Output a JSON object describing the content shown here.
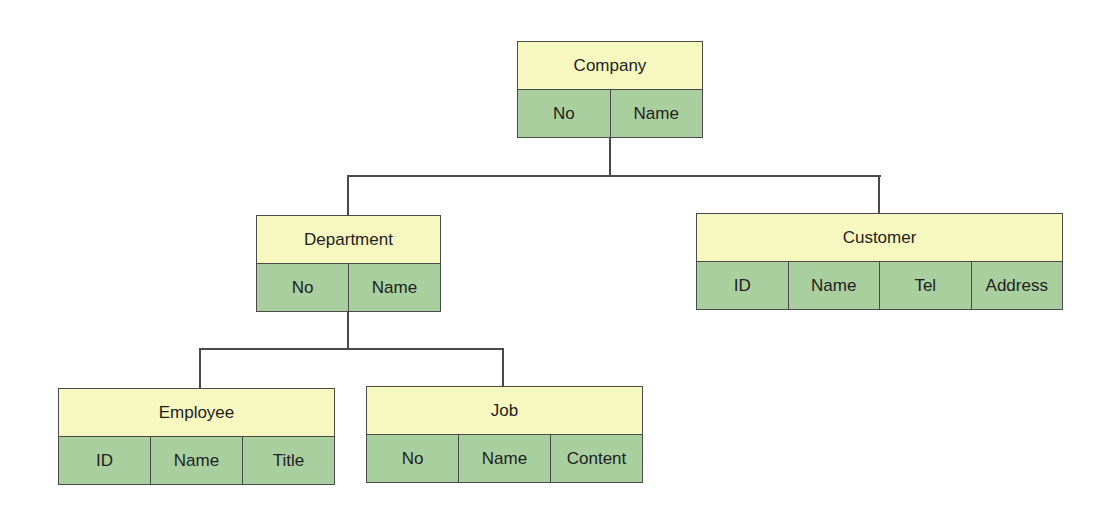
{
  "diagram": {
    "type": "hierarchy",
    "colors": {
      "header": "#f7f7c0",
      "fields": "#a9cf9e",
      "border": "#4a4a4a",
      "text": "#1e1e1e"
    },
    "entities": {
      "company": {
        "title": "Company",
        "fields": [
          "No",
          "Name"
        ]
      },
      "department": {
        "title": "Department",
        "fields": [
          "No",
          "Name"
        ]
      },
      "customer": {
        "title": "Customer",
        "fields": [
          "ID",
          "Name",
          "Tel",
          "Address"
        ]
      },
      "employee": {
        "title": "Employee",
        "fields": [
          "ID",
          "Name",
          "Title"
        ]
      },
      "job": {
        "title": "Job",
        "fields": [
          "No",
          "Name",
          "Content"
        ]
      }
    },
    "relations": [
      {
        "parent": "Company",
        "child": "Department"
      },
      {
        "parent": "Company",
        "child": "Customer"
      },
      {
        "parent": "Department",
        "child": "Employee"
      },
      {
        "parent": "Department",
        "child": "Job"
      }
    ]
  }
}
